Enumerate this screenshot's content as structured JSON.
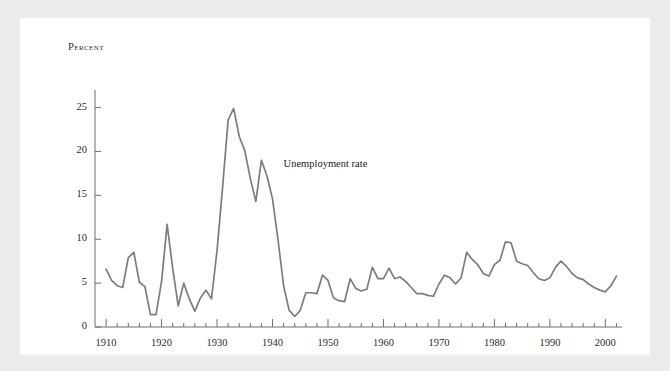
{
  "figure": {
    "background_color": "#ececec",
    "panel_color": "#ffffff",
    "line_color": "#7d7d7d",
    "axis_color": "#6e6e6e",
    "text_color": "#2b2b2b"
  },
  "chart_data": {
    "type": "line",
    "title": "",
    "subtitle": "",
    "xlabel": "",
    "ylabel": "Percent",
    "xlim": [
      1908,
      2003
    ],
    "ylim": [
      0,
      27
    ],
    "grid": false,
    "legend_position": "inline-annotation",
    "xticks": [
      1910,
      1920,
      1930,
      1940,
      1950,
      1960,
      1970,
      1980,
      1990,
      2000
    ],
    "xtick_labels": [
      "1910",
      "1920",
      "1930",
      "1940",
      "1950",
      "1960",
      "1970",
      "1980",
      "1990",
      "2000"
    ],
    "minor_xtick_interval": 2,
    "yticks": [
      0,
      5,
      10,
      15,
      20,
      25
    ],
    "ytick_labels": [
      "0",
      "5",
      "10",
      "15",
      "20",
      "25"
    ],
    "annotations": [
      {
        "text": "Unemployment rate",
        "x": 1942,
        "y": 18.4
      }
    ],
    "series": [
      {
        "name": "Unemployment rate",
        "color": "#7d7d7d",
        "x": [
          1910,
          1911,
          1912,
          1913,
          1914,
          1915,
          1916,
          1917,
          1918,
          1919,
          1920,
          1921,
          1922,
          1923,
          1924,
          1925,
          1926,
          1927,
          1928,
          1929,
          1930,
          1931,
          1932,
          1933,
          1934,
          1935,
          1936,
          1937,
          1938,
          1939,
          1940,
          1941,
          1942,
          1943,
          1944,
          1945,
          1946,
          1947,
          1948,
          1949,
          1950,
          1951,
          1952,
          1953,
          1954,
          1955,
          1956,
          1957,
          1958,
          1959,
          1960,
          1961,
          1962,
          1963,
          1964,
          1965,
          1966,
          1967,
          1968,
          1969,
          1970,
          1971,
          1972,
          1973,
          1974,
          1975,
          1976,
          1977,
          1978,
          1979,
          1980,
          1981,
          1982,
          1983,
          1984,
          1985,
          1986,
          1987,
          1988,
          1989,
          1990,
          1991,
          1992,
          1993,
          1994,
          1995,
          1996,
          1997,
          1998,
          1999,
          2000,
          2001,
          2002
        ],
        "values": [
          6.6,
          5.3,
          4.7,
          4.5,
          7.9,
          8.5,
          5.1,
          4.6,
          1.4,
          1.4,
          5.2,
          11.7,
          6.7,
          2.4,
          5.0,
          3.2,
          1.8,
          3.3,
          4.2,
          3.2,
          8.7,
          15.9,
          23.6,
          24.9,
          21.7,
          20.1,
          16.9,
          14.3,
          19.0,
          17.2,
          14.6,
          9.9,
          4.7,
          1.9,
          1.2,
          1.9,
          3.9,
          3.9,
          3.8,
          5.9,
          5.3,
          3.3,
          3.0,
          2.9,
          5.5,
          4.4,
          4.1,
          4.3,
          6.8,
          5.5,
          5.5,
          6.7,
          5.5,
          5.7,
          5.2,
          4.5,
          3.8,
          3.8,
          3.6,
          3.5,
          4.9,
          5.9,
          5.6,
          4.9,
          5.6,
          8.5,
          7.7,
          7.1,
          6.1,
          5.8,
          7.1,
          7.6,
          9.7,
          9.6,
          7.5,
          7.2,
          7.0,
          6.2,
          5.5,
          5.3,
          5.6,
          6.8,
          7.5,
          6.9,
          6.1,
          5.6,
          5.4,
          4.9,
          4.5,
          4.2,
          4.0,
          4.7,
          5.8
        ]
      }
    ]
  }
}
